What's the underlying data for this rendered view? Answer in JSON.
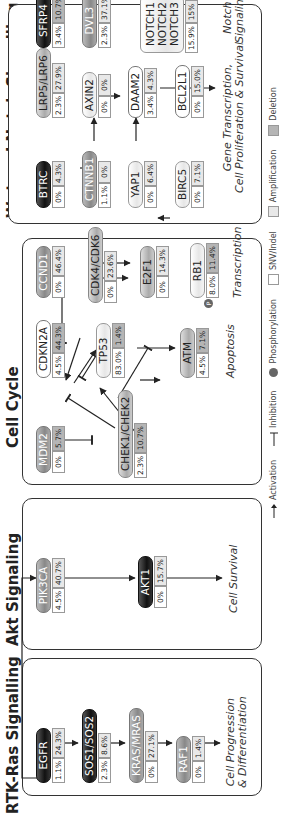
{
  "sections": {
    "rtk": {
      "title": "RTK-Ras Signalling"
    },
    "akt": {
      "title": "Akt Signaling"
    },
    "cellcycle": {
      "title": "Cell Cycle"
    },
    "wnt": {
      "title": "Wnt and Notch Signalling"
    }
  },
  "nodes": {
    "egfr": {
      "label": "EGFR",
      "snv": "1.1%",
      "cnv": "24.3%"
    },
    "sos": {
      "label": "SOS1/SOS2",
      "snv": "2.3%",
      "cnv": "8.6%"
    },
    "kras": {
      "label": "KRAS/MRAS",
      "snv": "0%",
      "cnv": "27.1%"
    },
    "raf1": {
      "label": "RAF1",
      "snv": "0%",
      "cnv": "1.4%"
    },
    "pik3ca": {
      "label": "PIK3CA",
      "snv": "4.5%",
      "cnv": "40.7%"
    },
    "akt1": {
      "label": "AKT1",
      "snv": "0%",
      "cnv": "15.7%"
    },
    "mdm2": {
      "label": "MDM2",
      "snv": "0%",
      "cnv": "5.7%"
    },
    "chek": {
      "label": "CHEK1/CHEK2",
      "snv": "2.3%",
      "cnv": "10.7%"
    },
    "cdkn2a": {
      "label": "CDKN2A",
      "snv": "4.5%",
      "cnv": "44.3%"
    },
    "tp53": {
      "label": "TP53",
      "snv": "83.0%",
      "cnv": "1.4%"
    },
    "atm": {
      "label": "ATM",
      "snv": "4.5%",
      "cnv": "7.1%"
    },
    "ccnd1": {
      "label": "CCND1",
      "snv": "0%",
      "cnv": "46.4%"
    },
    "cdk46": {
      "label": "CDK4/CDK6",
      "snv": "0%",
      "cnv": "23.6%"
    },
    "e2f1": {
      "label": "E2F1",
      "snv": "0%",
      "cnv": "14.3%"
    },
    "rb1": {
      "label": "RB1",
      "snv": "8.0%",
      "cnv": "11.4%",
      "phos": "P"
    },
    "btrc": {
      "label": "BTRC",
      "snv": "0%",
      "cnv": "4.3%"
    },
    "ctnnb1": {
      "label": "CTNNB1",
      "snv": "1.1%",
      "cnv": "0%"
    },
    "yap1": {
      "label": "YAP1",
      "snv": "0%",
      "cnv": "6.4%"
    },
    "birc5": {
      "label": "BIRC5",
      "snv": "0%",
      "cnv": "7.1%"
    },
    "lrp": {
      "label": "LRP5/LRP6",
      "snv": "2.3%",
      "cnv": "27.9%"
    },
    "axin2": {
      "label": "AXIN2",
      "snv": "0%",
      "cnv": "0%"
    },
    "daam2": {
      "label": "DAAM2",
      "snv": "3.4%",
      "cnv": "4.3%"
    },
    "bcl2l1": {
      "label": "BCL2L1",
      "snv": "0%",
      "cnv": "15.0%"
    },
    "sfrp4": {
      "label": "SFRP4",
      "snv": "3.4%",
      "cnv": "10.7%"
    },
    "dvl3": {
      "label": "DVL3",
      "snv": "2.3%",
      "cnv": "37.1%"
    },
    "notch": {
      "label1": "NOTCH1",
      "label2": "NOTCH2",
      "label3": "NOTCH3",
      "snv": "15.9%",
      "cnv": "15%"
    }
  },
  "outcomes": {
    "rtk": {
      "line1": "Cell Progression",
      "line2": "& Differentiation"
    },
    "akt": {
      "line1": "Cell Survival"
    },
    "apoptosis": {
      "line1": "Apoptosis"
    },
    "transcription": {
      "line1": "Transcription"
    },
    "wnt": {
      "line1": "Gene Transcription,",
      "line2": "Cell Proliferation & Survival"
    },
    "notch": {
      "line1": "Notch",
      "line2": "Signaling"
    }
  },
  "legend": {
    "activation": "Activation",
    "inhibition": "Inhibition",
    "phosphorylation": "Phosphorylation",
    "snv": "SNV/Indel",
    "amplification": "Amplification",
    "deletion": "Deletion"
  }
}
